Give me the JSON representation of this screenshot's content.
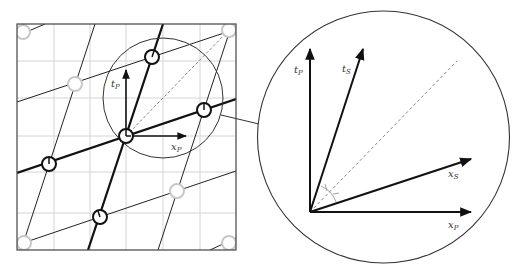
{
  "left_panel": {
    "axis_labels": {
      "time": "t",
      "time_sub": "P",
      "space": "x",
      "space_sub": "P"
    }
  },
  "zoom_panel": {
    "axis_labels": {
      "tP": "t",
      "tP_sub": "P",
      "tS": "t",
      "tS_sub": "S",
      "xS": "x",
      "xS_sub": "S",
      "xP": "x",
      "xP_sub": "P"
    }
  },
  "colors": {
    "grid": "#d0d0d0",
    "line": "#111111",
    "faded_clock": "#c8c8c8",
    "dashed": "#888888"
  }
}
